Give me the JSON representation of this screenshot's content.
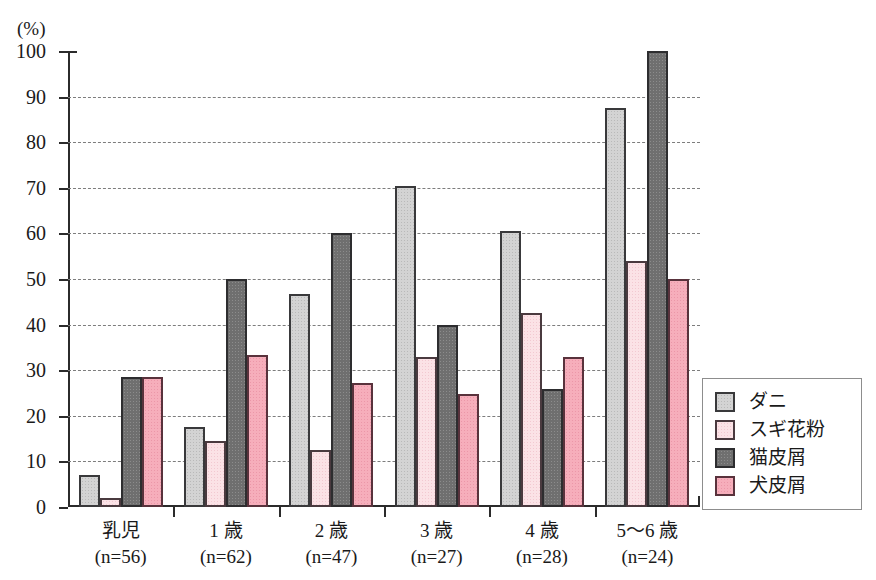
{
  "chart_data": {
    "type": "bar",
    "title": "",
    "subtitle": "",
    "xlabel": "",
    "ylabel": "",
    "unit_label": "(%)",
    "ylim": [
      0,
      100
    ],
    "ytick_values": [
      0,
      10,
      20,
      30,
      40,
      50,
      60,
      70,
      80,
      90,
      100
    ],
    "ytick_labels": [
      "0",
      "10",
      "20",
      "30",
      "40",
      "50",
      "60",
      "70",
      "80",
      "90",
      "100"
    ],
    "grid": true,
    "grid_style": "dashed-horizontal",
    "legend_position": "right-outside",
    "categories": [
      "乳児",
      "1 歳",
      "2 歳",
      "3 歳",
      "4 歳",
      "5〜6 歳"
    ],
    "category_sublabels": [
      "(n=56)",
      "(n=62)",
      "(n=47)",
      "(n=27)",
      "(n=28)",
      "(n=24)"
    ],
    "series": [
      {
        "name": "ダニ",
        "color": "#d3d3d3",
        "values": [
          7.0,
          17.5,
          46.8,
          70.4,
          60.5,
          87.5
        ]
      },
      {
        "name": "スギ花粉",
        "color": "#fbe2e6",
        "values": [
          2.0,
          14.5,
          12.5,
          33.0,
          42.5,
          54.0
        ]
      },
      {
        "name": "猫皮屑",
        "color": "#6f6f6f",
        "values": [
          28.5,
          50.0,
          60.0,
          40.0,
          25.8,
          100.0
        ]
      },
      {
        "name": "犬皮屑",
        "color": "#f6aebb",
        "values": [
          28.5,
          33.3,
          27.1,
          24.8,
          33.0,
          50.0
        ]
      }
    ]
  },
  "legend": {
    "items": [
      {
        "label": "ダニ"
      },
      {
        "label": "スギ花粉"
      },
      {
        "label": "猫皮屑"
      },
      {
        "label": "犬皮屑"
      }
    ]
  }
}
